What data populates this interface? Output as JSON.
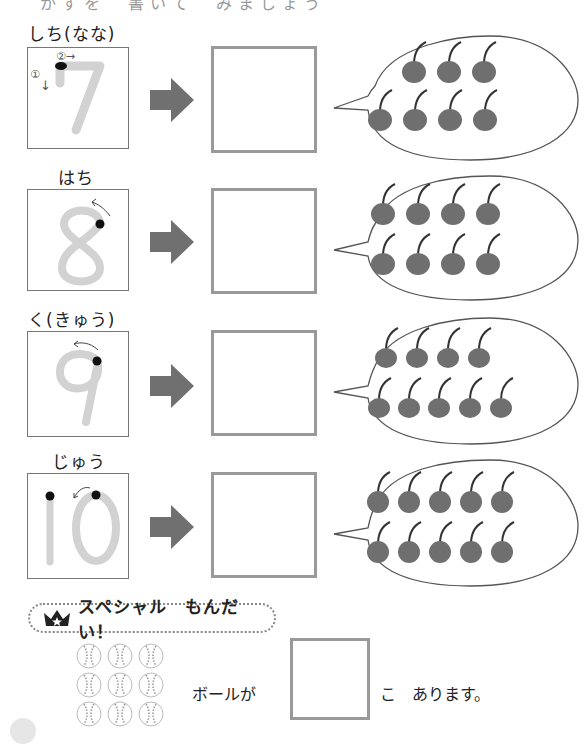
{
  "header": {
    "cut_off_text": "かずを　書いて　みましょう"
  },
  "colors": {
    "trace_gray": "#d2d2d2",
    "arrow_gray": "#707070",
    "cherry_fill": "#6f6f6f",
    "stem": "#333333",
    "answer_border": "#999999"
  },
  "rows": [
    {
      "label": "しち(なな)",
      "numeral": "7",
      "stroke_hints": [
        "①↓",
        "②→"
      ],
      "cherry_count": 7,
      "cherry_rows": [
        3,
        4
      ]
    },
    {
      "label": "はち",
      "numeral": "8",
      "stroke_hints": [
        "↖"
      ],
      "cherry_count": 8,
      "cherry_rows": [
        4,
        4
      ]
    },
    {
      "label": "く(きゅう)",
      "numeral": "9",
      "stroke_hints": [
        "←"
      ],
      "cherry_count": 9,
      "cherry_rows": [
        4,
        5
      ]
    },
    {
      "label": "じゅう",
      "numeral": "10",
      "stroke_hints": [
        "↙"
      ],
      "cherry_count": 10,
      "cherry_rows": [
        5,
        5
      ]
    }
  ],
  "special": {
    "icon": "crown-icon",
    "title": "スペシャル　もんだい！",
    "ball_count": 9,
    "ball_grid": [
      3,
      3
    ],
    "prefix": "ボールが",
    "suffix": "こ　あります。",
    "answer_value": ""
  }
}
